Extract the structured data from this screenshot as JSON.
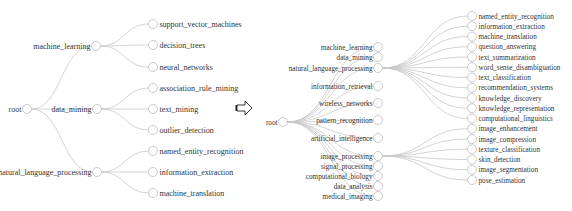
{
  "left_tree": {
    "root": {
      "label": "root",
      "x": 27,
      "y": 109
    },
    "children": [
      {
        "label": "machine_learning",
        "x": 96,
        "y": 46,
        "children": [
          {
            "label": "support_vector_machines",
            "y": 24
          },
          {
            "label": "decision_trees",
            "y": 45
          },
          {
            "label": "neural_networks",
            "y": 67
          }
        ]
      },
      {
        "label": "data_mining",
        "x": 97,
        "y": 109,
        "children": [
          {
            "label": "association_rule_mining",
            "y": 88
          },
          {
            "label": "text_mining",
            "y": 109
          },
          {
            "label": "outlier_detection",
            "y": 130
          }
        ]
      },
      {
        "label": "natural_language_processing",
        "x": 97,
        "y": 172,
        "children": [
          {
            "label": "named_entity_recognition",
            "y": 151
          },
          {
            "label": "information_extraction",
            "y": 172
          },
          {
            "label": "machine_translation",
            "y": 193
          }
        ]
      }
    ],
    "leaf_x": 153
  },
  "arrow": {
    "icon": "right-arrow-icon",
    "x": 237,
    "y": 108
  },
  "right_tree": {
    "root": {
      "label": "root",
      "x": 283,
      "y": 122
    },
    "mid_x": 378,
    "leaf_x": 472,
    "children": [
      {
        "label": "machine_learning",
        "y": 47
      },
      {
        "label": "data_mining",
        "y": 57
      },
      {
        "label": "natural_language_processing",
        "y": 68,
        "children": [
          "named_entity_recognition",
          "information_extraction",
          "machine_translation",
          "question_answering",
          "text_summarization",
          "word_sense_disambiguation",
          "text_classification",
          "recommendation_systems",
          "knowledge_discovery",
          "knowledge_representation",
          "computational_linguistics"
        ]
      },
      {
        "label": "information_retrieval",
        "y": 86
      },
      {
        "label": "wireless_networks",
        "y": 103
      },
      {
        "label": "pattern_recognition",
        "y": 120
      },
      {
        "label": "artificial_intelligence",
        "y": 138
      },
      {
        "label": "image_processing",
        "y": 156,
        "children": [
          "image_enhancement",
          "image_compression",
          "texture_classification",
          "skin_detection",
          "image_segmentation",
          "pose_estimation"
        ]
      },
      {
        "label": "signal_processing",
        "y": 166
      },
      {
        "label": "computational_biology",
        "y": 176
      },
      {
        "label": "data_analysis",
        "y": 186
      },
      {
        "label": "medical_imaging",
        "y": 196
      }
    ],
    "leaf_y_start": 16,
    "leaf_y_step": 10.25
  },
  "colors": {
    "link": "#c8c8c8",
    "node_stroke": "#bdbdbd",
    "text": "#333333"
  }
}
